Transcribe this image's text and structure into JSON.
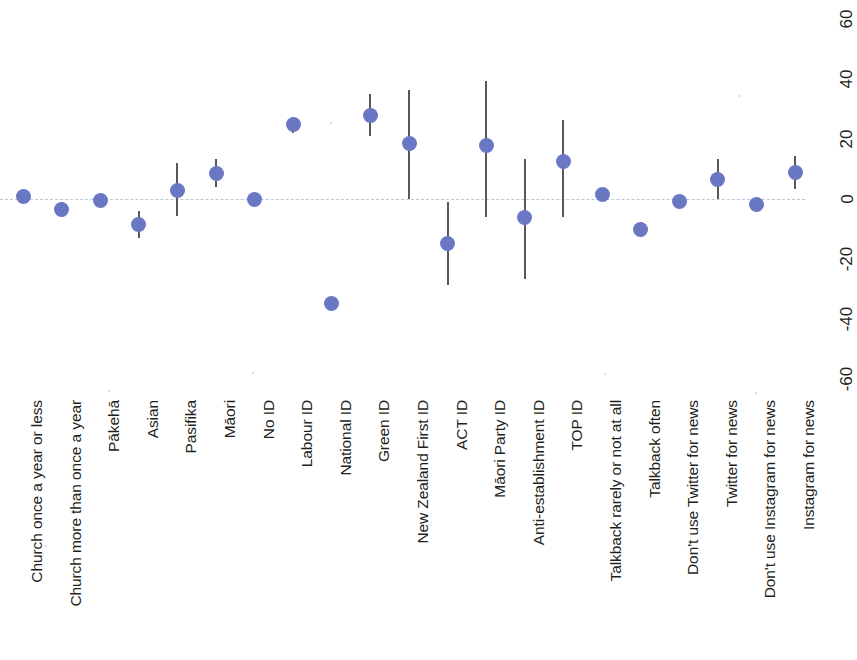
{
  "chart_data": {
    "type": "scatter",
    "title": "",
    "subtitle": "",
    "xlabel": "",
    "ylabel": "",
    "ylim": [
      -68,
      68
    ],
    "yticks": [
      60,
      40,
      20,
      0,
      -20,
      -40,
      -60
    ],
    "ytick_labels": [
      "60",
      "40",
      "20",
      "0",
      "-20",
      "-40",
      "-60"
    ],
    "grid": false,
    "legend": "none",
    "zero_reference_line": true,
    "orientation": "rotated-labels-vertical",
    "point_color": "#6a78c4",
    "errorbar_color": "#59595b",
    "zero_line_color": "#b9c2d8",
    "categories": [
      "Church once a year or less",
      "Church more than once a year",
      "Pākehā",
      "Asian",
      "Pasifika",
      "Māori",
      "No ID",
      "Labour ID",
      "National ID",
      "Green ID",
      "New Zealand First ID",
      "ACT ID",
      "Māori Party ID",
      "Anti-establishment ID",
      "TOP ID",
      "Talkback rarely or not at all",
      "Talkback often",
      "Don't use Twitter for news",
      "Twitter for news",
      "Don't use Instagram for news",
      "Instagram for news"
    ],
    "points": [
      {
        "label": "Church once a year or less",
        "value": 1.0,
        "ci_low": 1.0,
        "ci_high": 1.0
      },
      {
        "label": "Church more than once a year",
        "value": -3.5,
        "ci_low": -6.0,
        "ci_high": -1.0
      },
      {
        "label": "Pākehā",
        "value": -0.5,
        "ci_low": -0.5,
        "ci_high": -0.5
      },
      {
        "label": "Asian",
        "value": -8.5,
        "ci_low": -13.0,
        "ci_high": -4.0
      },
      {
        "label": "Pasifika",
        "value": 3.0,
        "ci_low": -5.5,
        "ci_high": 12.0
      },
      {
        "label": "Māori",
        "value": 8.5,
        "ci_low": 4.0,
        "ci_high": 13.5
      },
      {
        "label": "No ID",
        "value": -0.3,
        "ci_low": -2.0,
        "ci_high": 1.5
      },
      {
        "label": "Labour ID",
        "value": 24.7,
        "ci_low": 22.0,
        "ci_high": 27.5
      },
      {
        "label": "National ID",
        "value": -34.8,
        "ci_low": -36.5,
        "ci_high": -33.0
      },
      {
        "label": "Green ID",
        "value": 27.8,
        "ci_low": 21.0,
        "ci_high": 35.0
      },
      {
        "label": "New Zealand First ID",
        "value": 18.5,
        "ci_low": 0.0,
        "ci_high": 36.5
      },
      {
        "label": "ACT ID",
        "value": -14.8,
        "ci_low": -28.5,
        "ci_high": -1.0
      },
      {
        "label": "Māori Party ID",
        "value": 18.0,
        "ci_low": -6.0,
        "ci_high": 39.5
      },
      {
        "label": "Anti-establishment ID",
        "value": -6.0,
        "ci_low": -26.5,
        "ci_high": 13.5
      },
      {
        "label": "TOP ID",
        "value": 12.5,
        "ci_low": -6.0,
        "ci_high": 26.5
      },
      {
        "label": "Talkback rarely or not at all",
        "value": 1.5,
        "ci_low": 0.0,
        "ci_high": 3.0
      },
      {
        "label": "Talkback often",
        "value": -10.0,
        "ci_low": -12.5,
        "ci_high": -7.5
      },
      {
        "label": "Don't use Twitter for news",
        "value": -0.8,
        "ci_low": -2.0,
        "ci_high": 0.5
      },
      {
        "label": "Twitter for news",
        "value": 6.5,
        "ci_low": 0.0,
        "ci_high": 13.5
      },
      {
        "label": "Don't use Instagram for news",
        "value": -1.8,
        "ci_low": -3.0,
        "ci_high": -0.5
      },
      {
        "label": "Instagram for news",
        "value": 9.0,
        "ci_low": 3.5,
        "ci_high": 14.5
      }
    ]
  }
}
